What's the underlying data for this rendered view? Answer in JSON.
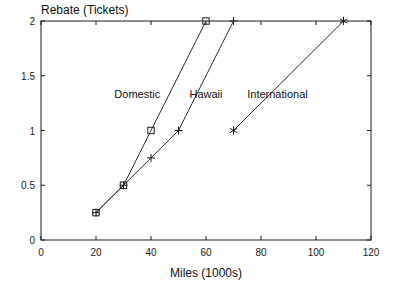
{
  "chart_data": {
    "type": "line",
    "title": "",
    "ylabel": "Rebate (Tickets)",
    "xlabel": "Miles (1000s)",
    "xlim": [
      0,
      120
    ],
    "ylim": [
      0,
      2
    ],
    "xticks": [
      0,
      20,
      40,
      60,
      80,
      100,
      120
    ],
    "xticklabels": [
      "0",
      "20",
      "40",
      "60",
      "80",
      "100",
      "120"
    ],
    "yticks": [
      0,
      0.5,
      1,
      1.5,
      2
    ],
    "yticklabels": [
      "0",
      "0.5",
      "1",
      "1.5",
      "2"
    ],
    "grid": false,
    "legend": "inline-annotations",
    "series": [
      {
        "name": "Domestic",
        "marker": "square",
        "x": [
          20,
          30,
          40,
          60
        ],
        "y": [
          0.25,
          0.5,
          1,
          2
        ],
        "label_x": 35,
        "label_y": 1.3
      },
      {
        "name": "Hawaii",
        "marker": "plus",
        "x": [
          20,
          30,
          40,
          50,
          70
        ],
        "y": [
          0.25,
          0.5,
          0.75,
          1,
          2
        ],
        "label_x": 60,
        "label_y": 1.3
      },
      {
        "name": "International",
        "marker": "asterisk",
        "x": [
          70,
          110
        ],
        "y": [
          1,
          2
        ],
        "label_x": 86,
        "label_y": 1.3
      }
    ],
    "colors": {
      "line": "#2b2b2b",
      "axis": "#1a1a1a",
      "text": "#111111",
      "background": "#ffffff"
    }
  },
  "axes": {
    "y_axis_title": "Rebate (Tickets)",
    "x_axis_title": "Miles (1000s)"
  }
}
